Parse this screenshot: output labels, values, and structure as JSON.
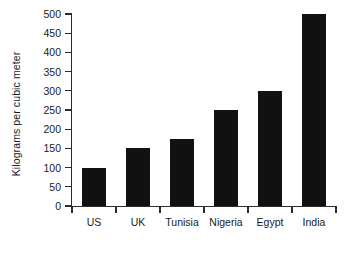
{
  "chart_data": {
    "type": "bar",
    "title": "",
    "subtitle": "",
    "xlabel": "",
    "ylabel": "Kilograms per cubic meter",
    "categories": [
      "US",
      "UK",
      "Tunisia",
      "Nigeria",
      "Egypt",
      "India"
    ],
    "values": [
      100,
      150,
      175,
      250,
      300,
      500
    ],
    "series": [
      {
        "name": "Kilograms per cubic meter",
        "values": [
          100,
          150,
          175,
          250,
          300,
          500
        ]
      }
    ],
    "ylim": [
      0,
      500
    ],
    "ytick_labels": [
      "0",
      "50",
      "100",
      "150",
      "200",
      "250",
      "300",
      "350",
      "400",
      "450",
      "500"
    ],
    "ytick_values": [
      0,
      50,
      100,
      150,
      200,
      250,
      300,
      350,
      400,
      450,
      500
    ],
    "grid": false,
    "legend": false,
    "legend_position": "none",
    "bar_color": "#111111",
    "axis_color": "#2b2b2b",
    "background_color": "#ffffff",
    "annotations": []
  }
}
